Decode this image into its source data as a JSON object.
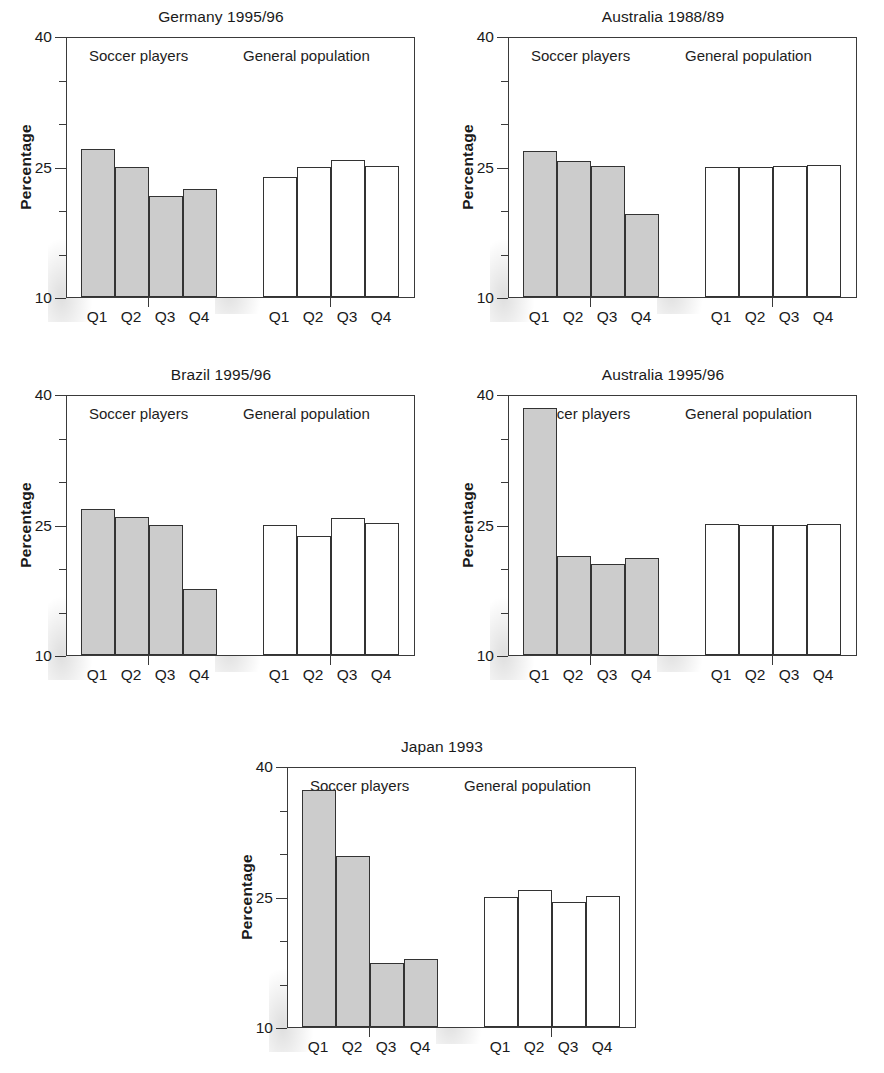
{
  "chart_data": {
    "type": "bar",
    "title": "",
    "panels": [
      {
        "title": "Germany 1995/96",
        "ylabel": "Percentage",
        "ylim": [
          10,
          40
        ],
        "yticks": [
          10,
          25,
          40
        ],
        "yticks_minor": [
          15,
          20,
          30,
          35
        ],
        "categories": [
          "Q1",
          "Q2",
          "Q3",
          "Q4"
        ],
        "groups": [
          {
            "label": "Soccer players",
            "key": "soccer",
            "values": [
              27.0,
              25.0,
              21.6,
              22.4
            ]
          },
          {
            "label": "General population",
            "key": "general",
            "values": [
              23.8,
              25.0,
              25.8,
              25.1
            ]
          }
        ]
      },
      {
        "title": "Australia 1988/89",
        "ylabel": "Percentage",
        "ylim": [
          10,
          40
        ],
        "yticks": [
          10,
          25,
          40
        ],
        "yticks_minor": [
          15,
          20,
          30,
          35
        ],
        "categories": [
          "Q1",
          "Q2",
          "Q3",
          "Q4"
        ],
        "groups": [
          {
            "label": "Soccer players",
            "key": "soccer",
            "values": [
              26.8,
              25.6,
              25.1,
              19.5
            ]
          },
          {
            "label": "General population",
            "key": "general",
            "values": [
              24.9,
              24.9,
              25.1,
              25.2
            ]
          }
        ]
      },
      {
        "title": "Brazil 1995/96",
        "ylabel": "Percentage",
        "ylim": [
          10,
          40
        ],
        "yticks": [
          10,
          25,
          40
        ],
        "yticks_minor": [
          15,
          20,
          30,
          35
        ],
        "categories": [
          "Q1",
          "Q2",
          "Q3",
          "Q4"
        ],
        "groups": [
          {
            "label": "Soccer players",
            "key": "soccer",
            "values": [
              26.8,
              25.9,
              25.0,
              17.6
            ]
          },
          {
            "label": "General population",
            "key": "general",
            "values": [
              25.0,
              23.7,
              25.8,
              25.2
            ]
          }
        ]
      },
      {
        "title": "Australia 1995/96",
        "ylabel": "Percentage",
        "ylim": [
          10,
          40
        ],
        "yticks": [
          10,
          25,
          40
        ],
        "yticks_minor": [
          15,
          20,
          30,
          35
        ],
        "categories": [
          "Q1",
          "Q2",
          "Q3",
          "Q4"
        ],
        "groups": [
          {
            "label": "Soccer players",
            "key": "soccer",
            "values": [
              38.4,
              21.4,
              20.5,
              21.2
            ]
          },
          {
            "label": "General population",
            "key": "general",
            "values": [
              25.1,
              25.0,
              25.0,
              25.1
            ]
          }
        ]
      },
      {
        "title": "Japan 1993",
        "ylabel": "Percentage",
        "ylim": [
          10,
          40
        ],
        "yticks": [
          10,
          25,
          40
        ],
        "yticks_minor": [
          15,
          20,
          30,
          35
        ],
        "categories": [
          "Q1",
          "Q2",
          "Q3",
          "Q4"
        ],
        "groups": [
          {
            "label": "Soccer players",
            "key": "soccer",
            "values": [
              37.2,
              29.6,
              17.4,
              17.8
            ]
          },
          {
            "label": "General population",
            "key": "general",
            "values": [
              25.0,
              25.8,
              24.4,
              25.1
            ]
          }
        ]
      }
    ]
  }
}
